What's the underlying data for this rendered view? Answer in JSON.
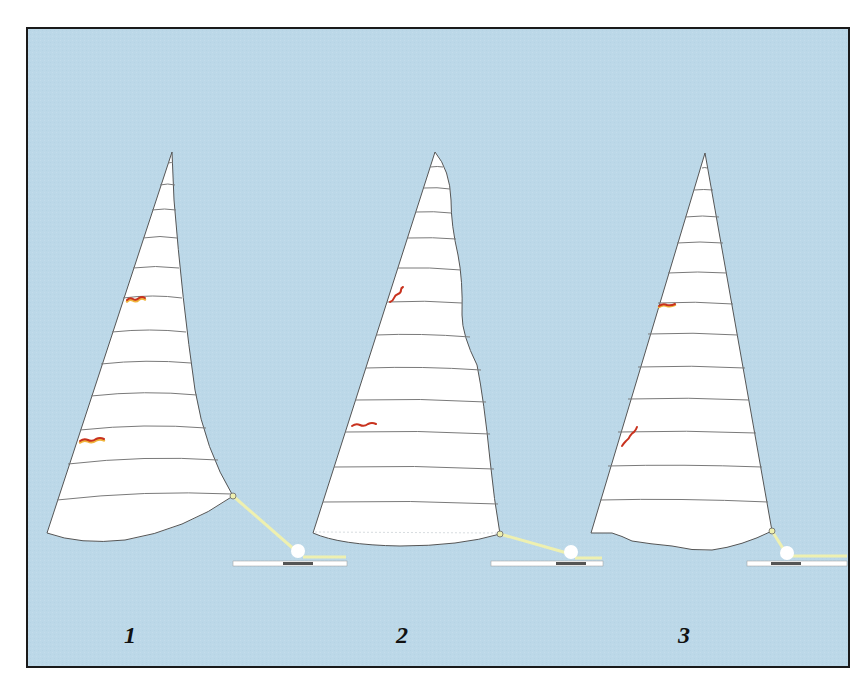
{
  "figure": {
    "background_color": "#bcd8e8",
    "border_color": "#1a1a1a",
    "sail_fill": "#ffffff",
    "outline_color": "#555555",
    "batten_color": "#7a7a7a",
    "telltale_color": "#c8321e",
    "telltale_shadow_color": "#f0b43c",
    "sheet_color": "#eef0b0",
    "track_color": "#ffffff",
    "car_color": "#555555",
    "block_color": "#ffffff"
  },
  "sails": [
    {
      "id": "1",
      "label": "1",
      "description": "Sail with hooked / cupped leech and deep foot",
      "telltales": 2
    },
    {
      "id": "2",
      "label": "2",
      "description": "Sail with wavy, fluttering upper leech",
      "telltales": 2
    },
    {
      "id": "3",
      "label": "3",
      "description": "Sail with wrinkled, scalloped foot",
      "telltales": 2
    }
  ]
}
